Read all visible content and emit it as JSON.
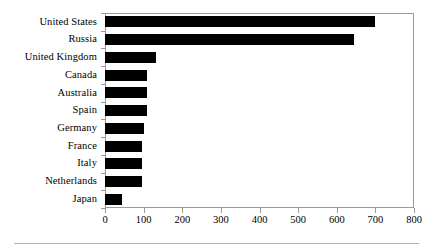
{
  "chart_data": {
    "type": "bar",
    "orientation": "horizontal",
    "title": "",
    "subtitle": "",
    "xlabel": "",
    "ylabel": "",
    "categories": [
      "United States",
      "Russia",
      "United Kingdom",
      "Canada",
      "Australia",
      "Spain",
      "Germany",
      "France",
      "Italy",
      "Netherlands",
      "Japan"
    ],
    "values": [
      700,
      645,
      133,
      110,
      110,
      110,
      100,
      96,
      96,
      96,
      45
    ],
    "xlim": [
      0,
      800
    ],
    "xticks": [
      0,
      100,
      200,
      300,
      400,
      500,
      600,
      700,
      800
    ],
    "xtick_labels": [
      "0",
      "100",
      "200",
      "300",
      "400",
      "500",
      "600",
      "700",
      "800"
    ],
    "grid": false,
    "legend": false,
    "legend_position": "none",
    "bar_color": "#000000",
    "frame_color": "#9a9a9a",
    "background_color": "#ffffff",
    "annotations": []
  },
  "figure": {
    "footer_rule_color": "#b4b4b4"
  }
}
